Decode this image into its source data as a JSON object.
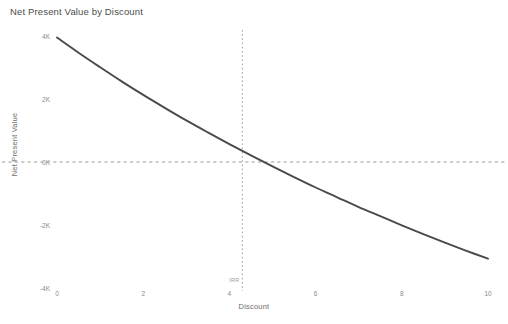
{
  "chart_data": {
    "type": "line",
    "title": "Net Present Value by Discount",
    "xlabel": "Discount",
    "ylabel": "Net Present Value",
    "xlim": [
      0,
      10
    ],
    "ylim": [
      -4000,
      4000
    ],
    "grid": false,
    "legend": null,
    "line_color": "#4a4a4a",
    "x": [
      0,
      0.5,
      1,
      1.5,
      2,
      2.5,
      3,
      3.5,
      4,
      4.5,
      5,
      5.5,
      6,
      6.5,
      7,
      7.5,
      8,
      8.5,
      9,
      9.5,
      10
    ],
    "y": [
      3950,
      3470,
      3010,
      2560,
      2130,
      1720,
      1320,
      940,
      570,
      210,
      -140,
      -480,
      -810,
      -1120,
      -1430,
      -1720,
      -2010,
      -2290,
      -2560,
      -2820,
      -3070
    ],
    "xticks": [
      0,
      2,
      4,
      6,
      8,
      10
    ],
    "xticklabels": [
      "0",
      "2",
      "4",
      "6",
      "8",
      "10"
    ],
    "yticks": [
      4000,
      2000,
      0,
      -2000,
      -4000
    ],
    "yticklabels": [
      "4K",
      "2K",
      "0K",
      "-2K",
      "-4K"
    ],
    "reference_lines": [
      {
        "name": "zero-npv-line",
        "orientation": "horizontal",
        "value": 0,
        "style": "dashed",
        "color": "#9a9a9a"
      },
      {
        "name": "irr-line",
        "orientation": "vertical",
        "value": 4.3,
        "style": "dotted",
        "color": "#9a9a9a",
        "label": "IRR"
      }
    ],
    "annotations": [
      {
        "name": "irr-label",
        "text": "IRR",
        "x": 4.3,
        "y": -3650
      }
    ]
  }
}
